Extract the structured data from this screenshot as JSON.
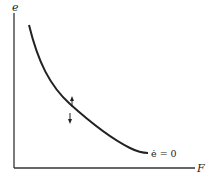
{
  "diagram": {
    "type": "phase-diagram",
    "axes": {
      "y_label": "e",
      "x_label": "F"
    },
    "curve": {
      "label": "ė = 0",
      "shape": "downward-sloping convex"
    },
    "arrows": [
      {
        "direction": "up",
        "position": "above curve"
      },
      {
        "direction": "down",
        "position": "below curve"
      }
    ],
    "colors": {
      "line": "#222222",
      "background": "#ffffff"
    }
  }
}
